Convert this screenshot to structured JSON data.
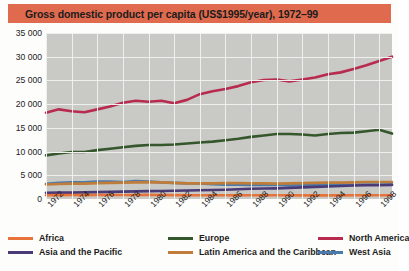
{
  "title": "Gross domestic product per capita (US$1995/year), 1972–99",
  "title_bar_color": "#e06a4e",
  "plot_bg_color": "#c9c9c5",
  "gridline_color": "#efefee",
  "legend": {
    "items": [
      {
        "label": "Africa",
        "color": "#e8733a",
        "col": 0,
        "row": 0
      },
      {
        "label": "Europe",
        "color": "#35572c",
        "col": 1,
        "row": 0
      },
      {
        "label": "North America",
        "color": "#b82a4e",
        "col": 2,
        "row": 0
      },
      {
        "label": "Asia and the Pacific",
        "color": "#4a3a78",
        "col": 0,
        "row": 1
      },
      {
        "label": "Latin America and the Caribbean",
        "color": "#c07d3a",
        "col": 1,
        "row": 1
      },
      {
        "label": "West Asia",
        "color": "#4a7aab",
        "col": 2,
        "row": 1
      }
    ]
  },
  "chart_data": {
    "type": "line",
    "title": "Gross domestic product per capita (US$1995/year), 1972–99",
    "xlabel": "",
    "ylabel": "",
    "ylim": [
      0,
      35000
    ],
    "xlim": [
      1972,
      1999
    ],
    "yticks": [
      0,
      5000,
      10000,
      15000,
      20000,
      25000,
      30000,
      35000
    ],
    "ytick_labels": [
      "0",
      "5 000",
      "10 000",
      "15 000",
      "20 000",
      "25 000",
      "30 000",
      "35 000"
    ],
    "xticks": [
      1972,
      1974,
      1976,
      1978,
      1980,
      1982,
      1984,
      1986,
      1988,
      1990,
      1992,
      1994,
      1996,
      1998
    ],
    "xtick_labels": [
      "1972",
      "1974",
      "1976",
      "1978",
      "1980",
      "1982",
      "1984",
      "1986",
      "1988",
      "1990",
      "1992",
      "1994",
      "1996",
      "1998"
    ],
    "grid": true,
    "legend_position": "below",
    "x": [
      1972,
      1973,
      1974,
      1975,
      1976,
      1977,
      1978,
      1979,
      1980,
      1981,
      1982,
      1983,
      1984,
      1985,
      1986,
      1987,
      1988,
      1989,
      1990,
      1991,
      1992,
      1993,
      1994,
      1995,
      1996,
      1997,
      1998,
      1999
    ],
    "series": [
      {
        "name": "North America",
        "color": "#b82a4e",
        "values": [
          18200,
          18900,
          18500,
          18300,
          18900,
          19500,
          20300,
          20700,
          20500,
          20700,
          20200,
          20900,
          22100,
          22700,
          23200,
          23800,
          24600,
          25100,
          25200,
          24800,
          25200,
          25600,
          26300,
          26700,
          27400,
          28200,
          29100,
          30000
        ]
      },
      {
        "name": "Europe",
        "color": "#35572c",
        "values": [
          9200,
          9600,
          9900,
          9900,
          10300,
          10600,
          10900,
          11200,
          11400,
          11400,
          11500,
          11700,
          11900,
          12100,
          12400,
          12700,
          13100,
          13400,
          13700,
          13700,
          13600,
          13400,
          13700,
          13900,
          14000,
          14300,
          14600,
          13800
        ]
      },
      {
        "name": "West Asia",
        "color": "#4a7aab",
        "values": [
          3200,
          3400,
          3500,
          3500,
          3700,
          3700,
          3600,
          3800,
          3700,
          3500,
          3400,
          3300,
          3300,
          3100,
          3000,
          3000,
          2950,
          2950,
          3000,
          2850,
          3000,
          3000,
          2950,
          2950,
          3000,
          3050,
          3050,
          3100
        ]
      },
      {
        "name": "Latin America and the Caribbean",
        "color": "#c07d3a",
        "values": [
          3050,
          3150,
          3250,
          3250,
          3350,
          3400,
          3450,
          3500,
          3550,
          3500,
          3400,
          3300,
          3300,
          3300,
          3350,
          3350,
          3300,
          3300,
          3250,
          3300,
          3350,
          3400,
          3450,
          3450,
          3500,
          3600,
          3600,
          3600
        ]
      },
      {
        "name": "Asia and the Pacific",
        "color": "#4a3a78",
        "values": [
          1300,
          1350,
          1350,
          1400,
          1450,
          1500,
          1550,
          1600,
          1650,
          1700,
          1750,
          1800,
          1850,
          1900,
          1950,
          2050,
          2150,
          2200,
          2250,
          2350,
          2450,
          2550,
          2650,
          2750,
          2850,
          2900,
          2900,
          2950
        ]
      },
      {
        "name": "Africa",
        "color": "#e8733a",
        "values": [
          800,
          820,
          830,
          820,
          840,
          850,
          840,
          850,
          860,
          840,
          820,
          800,
          800,
          800,
          790,
          780,
          790,
          790,
          790,
          780,
          770,
          760,
          760,
          770,
          780,
          790,
          790,
          800
        ]
      }
    ]
  }
}
